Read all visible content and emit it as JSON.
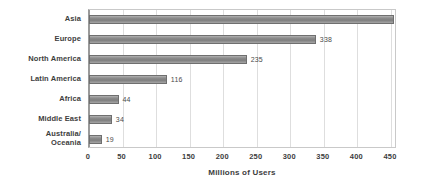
{
  "chart_data": {
    "type": "bar",
    "orientation": "horizontal",
    "title": "",
    "xlabel": "Millions of Users",
    "ylabel": "",
    "categories": [
      "Asia",
      "Europe",
      "North America",
      "Latin America",
      "Africa",
      "Middle East",
      "Australia/\nOceania"
    ],
    "values": [
      455,
      338,
      235,
      116,
      44,
      34,
      19
    ],
    "value_labels": [
      "",
      "338",
      "235",
      "116",
      "44",
      "34",
      "19"
    ],
    "xlim": [
      0,
      459
    ],
    "xticks": [
      0,
      50,
      100,
      150,
      200,
      250,
      300,
      350,
      400,
      450
    ],
    "xticklabels": [
      "0",
      "50",
      "100",
      "150",
      "200",
      "250",
      "300",
      "350",
      "400",
      "450"
    ],
    "grid": true,
    "grid_axis": "x",
    "legend": false,
    "bar_color": "#8d8d8d",
    "bar_border_color": "#6f6f6f",
    "grid_color": "#dedede",
    "axis_color": "#9a9a9a",
    "text_color": "#3d3d3d"
  }
}
